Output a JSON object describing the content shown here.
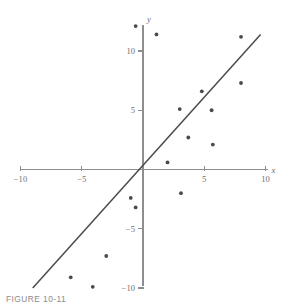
{
  "caption": "FIGURE 10-11",
  "colors": {
    "axis": "#8e8e90",
    "point": "#4a4a4c",
    "line": "#4b4b4d",
    "label": "#6d6d6f",
    "background": "#ffffff"
  },
  "axes": {
    "x_name": "x",
    "y_name": "y",
    "x_ticks": [
      "-10",
      "-5",
      "5",
      "10"
    ],
    "y_ticks": [
      "10",
      "5",
      "-5",
      "-10"
    ]
  },
  "chart_data": {
    "type": "scatter",
    "title": "",
    "xlabel": "x",
    "ylabel": "y",
    "xlim": [
      -10,
      10
    ],
    "ylim": [
      -10,
      12.5
    ],
    "grid": false,
    "legend": "none",
    "x_ticks": [
      -10,
      -5,
      5,
      10
    ],
    "y_ticks": [
      10,
      5,
      -5,
      -10
    ],
    "points": [
      {
        "x": -0.6,
        "y": 12.1
      },
      {
        "x": 1.1,
        "y": 11.4
      },
      {
        "x": 8.0,
        "y": 11.2
      },
      {
        "x": 8.0,
        "y": 7.3
      },
      {
        "x": 4.8,
        "y": 6.6
      },
      {
        "x": 3.0,
        "y": 5.1
      },
      {
        "x": 5.6,
        "y": 5.0
      },
      {
        "x": 3.7,
        "y": 2.7
      },
      {
        "x": 5.7,
        "y": 2.1
      },
      {
        "x": 2.0,
        "y": 0.6
      },
      {
        "x": 3.1,
        "y": -2.0
      },
      {
        "x": -1.0,
        "y": -2.4
      },
      {
        "x": -0.6,
        "y": -3.2
      },
      {
        "x": -3.0,
        "y": -7.3
      },
      {
        "x": -5.9,
        "y": -9.1
      },
      {
        "x": -4.1,
        "y": -9.9
      }
    ],
    "fit_line": {
      "label": "least-squares line",
      "x_start": -9.0,
      "y_start": -10.0,
      "x_end": 9.6,
      "y_end": 11.4
    }
  }
}
